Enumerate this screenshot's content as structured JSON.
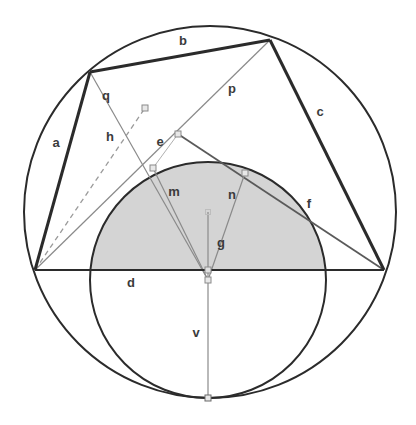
{
  "figure": {
    "background_color": "#ffffff",
    "outer_circle": {
      "name": "circumscribed-circle",
      "cx": 210,
      "cy": 212,
      "r": 186,
      "stroke": "#2b2b2b",
      "stroke_width": 2.0,
      "fill": "none"
    },
    "inner_circle": {
      "name": "inner-circle",
      "cx": 208,
      "cy": 280,
      "r": 118,
      "stroke": "#2b2b2b",
      "stroke_width": 2.0,
      "fill": "none"
    },
    "shaded_region": {
      "name": "shaded-circular-segment",
      "fill": "#d4d4d4",
      "description": "upper segment of inner circle above chord d"
    },
    "vertices": {
      "left": {
        "x": 35,
        "y": 270
      },
      "top_left": {
        "x": 90,
        "y": 72
      },
      "top_right": {
        "x": 270,
        "y": 40
      },
      "right": {
        "x": 384,
        "y": 270
      },
      "bottom": {
        "x": 208,
        "y": 398
      },
      "inner_center": {
        "x": 208,
        "y": 280
      },
      "crossing_e": {
        "x": 178,
        "y": 134
      },
      "foot_m": {
        "x": 153,
        "y": 168
      },
      "foot_n": {
        "x": 245,
        "y": 173
      },
      "mid_q": {
        "x": 145,
        "y": 108
      }
    },
    "thick_edges": [
      {
        "name": "edge-a",
        "from": "left",
        "to": "top_left",
        "stroke": "#2b2b2b",
        "width": 3.0
      },
      {
        "name": "edge-b",
        "from": "top_left",
        "to": "top_right",
        "stroke": "#2b2b2b",
        "width": 3.0
      },
      {
        "name": "edge-c",
        "from": "top_right",
        "to": "right",
        "stroke": "#2b2b2b",
        "width": 3.0
      },
      {
        "name": "edge-d",
        "from": "left",
        "to": "right",
        "stroke": "#2b2b2b",
        "width": 2.0
      }
    ],
    "thin_lines": [
      {
        "name": "line-q",
        "from": "top_left",
        "to": "inner_center",
        "stroke": "#7d7d7d",
        "width": 1.2
      },
      {
        "name": "line-p",
        "from": "top_right",
        "to": "left",
        "stroke": "#7d7d7d",
        "width": 1.2
      },
      {
        "name": "line-f",
        "from": "right",
        "to": "crossing_e",
        "stroke": "#5a5a5a",
        "width": 1.6
      },
      {
        "name": "line-m",
        "from": "inner_center",
        "to": "foot_m",
        "stroke": "#7d7d7d",
        "width": 1.2
      },
      {
        "name": "line-n",
        "from": "inner_center",
        "to": "foot_n",
        "stroke": "#7d7d7d",
        "width": 1.2
      },
      {
        "name": "line-g-v",
        "from": "inner_center",
        "to": "bottom",
        "stroke": "#7d7d7d",
        "width": 1.2
      },
      {
        "name": "line-e-to-m",
        "from": "crossing_e",
        "to": "foot_m",
        "stroke": "#a0a0a0",
        "width": 1.0
      }
    ],
    "dashed_lines": [
      {
        "name": "line-h",
        "from": "left",
        "to": "mid_q",
        "stroke": "#9a9a9a",
        "width": 1.2,
        "dash": "5,4"
      }
    ],
    "markers": [
      {
        "name": "marker-mid-q",
        "x": 145,
        "y": 108
      },
      {
        "name": "marker-crossing-e",
        "x": 178,
        "y": 134
      },
      {
        "name": "marker-foot-m",
        "x": 153,
        "y": 168
      },
      {
        "name": "marker-foot-n",
        "x": 245,
        "y": 173
      },
      {
        "name": "marker-inner-center",
        "x": 208,
        "y": 280
      },
      {
        "name": "marker-chord-center",
        "x": 208,
        "y": 270
      },
      {
        "name": "marker-bottom-tangency",
        "x": 208,
        "y": 398
      },
      {
        "name": "marker-inner-center-top",
        "x": 208,
        "y": 212
      }
    ],
    "labels": [
      {
        "id": "a",
        "text": "a",
        "x": 56,
        "y": 147
      },
      {
        "id": "b",
        "text": "b",
        "x": 183,
        "y": 45
      },
      {
        "id": "c",
        "text": "c",
        "x": 320,
        "y": 116
      },
      {
        "id": "d",
        "text": "d",
        "x": 131,
        "y": 287
      },
      {
        "id": "e",
        "text": "e",
        "x": 160,
        "y": 146
      },
      {
        "id": "f",
        "text": "f",
        "x": 309,
        "y": 208
      },
      {
        "id": "g",
        "text": "g",
        "x": 221,
        "y": 247
      },
      {
        "id": "h",
        "text": "h",
        "x": 110,
        "y": 141
      },
      {
        "id": "m",
        "text": "m",
        "x": 174,
        "y": 196
      },
      {
        "id": "n",
        "text": "n",
        "x": 232,
        "y": 199
      },
      {
        "id": "p",
        "text": "p",
        "x": 232,
        "y": 93
      },
      {
        "id": "q",
        "text": "q",
        "x": 106,
        "y": 100
      },
      {
        "id": "v",
        "text": "v",
        "x": 196,
        "y": 337
      }
    ],
    "colors": {
      "stroke_dark": "#2b2b2b",
      "stroke_mid": "#5a5a5a",
      "stroke_light": "#7d7d7d",
      "dash": "#9a9a9a",
      "shade": "#d4d4d4",
      "label": "#3b3b3b"
    }
  }
}
